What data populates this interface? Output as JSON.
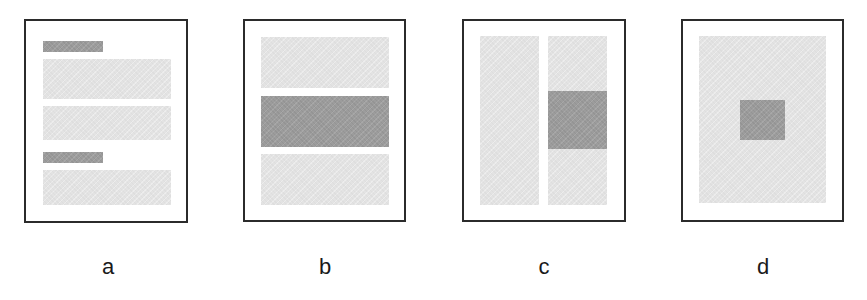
{
  "figure": {
    "colors": {
      "frame": "#2b2b2b",
      "light_block": "#e3e3e3",
      "dark_block": "#9c9c9c",
      "background": "#ffffff"
    },
    "panels": [
      {
        "label": "a",
        "layout": "two headings, each followed by text blocks",
        "frame": {
          "x": 24,
          "y": 19,
          "w": 164,
          "h": 204
        },
        "blocks": [
          {
            "role": "heading",
            "tone": "dark",
            "x": 43,
            "y": 41,
            "w": 60,
            "h": 11
          },
          {
            "role": "text",
            "tone": "light",
            "x": 43,
            "y": 59,
            "w": 128,
            "h": 40
          },
          {
            "role": "text",
            "tone": "light",
            "x": 43,
            "y": 106,
            "w": 128,
            "h": 34
          },
          {
            "role": "heading",
            "tone": "dark",
            "x": 43,
            "y": 152,
            "w": 60,
            "h": 11
          },
          {
            "role": "text",
            "tone": "light",
            "x": 43,
            "y": 170,
            "w": 128,
            "h": 35
          }
        ],
        "label_pos": {
          "x": 88,
          "y": 256
        }
      },
      {
        "label": "b",
        "layout": "three horizontal bands, middle band emphasized",
        "frame": {
          "x": 243,
          "y": 19,
          "w": 163,
          "h": 203
        },
        "blocks": [
          {
            "role": "band",
            "tone": "light",
            "x": 261,
            "y": 37,
            "w": 128,
            "h": 51
          },
          {
            "role": "band",
            "tone": "dark",
            "x": 261,
            "y": 96,
            "w": 128,
            "h": 51
          },
          {
            "role": "band",
            "tone": "light",
            "x": 261,
            "y": 154,
            "w": 128,
            "h": 51
          }
        ],
        "label_pos": {
          "x": 305,
          "y": 256
        }
      },
      {
        "label": "c",
        "layout": "two columns, emphasized block in right column",
        "frame": {
          "x": 462,
          "y": 19,
          "w": 164,
          "h": 203
        },
        "blocks": [
          {
            "role": "column",
            "tone": "light",
            "x": 480,
            "y": 36,
            "w": 59,
            "h": 169
          },
          {
            "role": "column",
            "tone": "light",
            "x": 548,
            "y": 36,
            "w": 59,
            "h": 169
          },
          {
            "role": "highlight",
            "tone": "dark",
            "x": 548,
            "y": 91,
            "w": 59,
            "h": 58
          }
        ],
        "label_pos": {
          "x": 524,
          "y": 256
        }
      },
      {
        "label": "d",
        "layout": "single full block with small centered emphasized square",
        "frame": {
          "x": 681,
          "y": 19,
          "w": 163,
          "h": 203
        },
        "blocks": [
          {
            "role": "body",
            "tone": "light",
            "x": 699,
            "y": 36,
            "w": 127,
            "h": 167
          },
          {
            "role": "highlight",
            "tone": "dark",
            "x": 740,
            "y": 100,
            "w": 45,
            "h": 40
          }
        ],
        "label_pos": {
          "x": 743,
          "y": 256
        }
      }
    ]
  }
}
